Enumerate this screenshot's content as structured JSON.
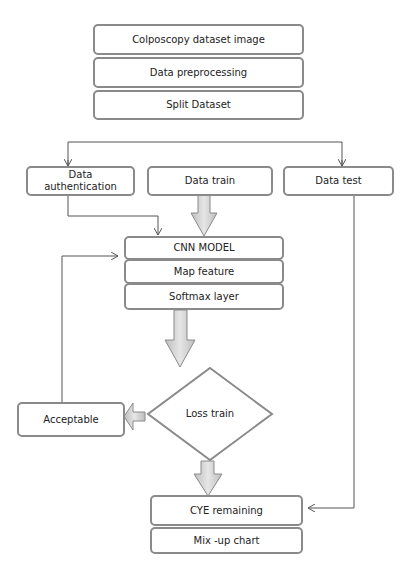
{
  "diagram": {
    "type": "flowchart",
    "top_stack": [
      "Colposcopy dataset image",
      "Data preprocessing",
      "Split Dataset"
    ],
    "split_branches": {
      "auth": "Data\nauthentication",
      "auth_line1": "Data",
      "auth_line2": "authentication",
      "train": "Data train",
      "test": "Data test"
    },
    "model_stack": [
      "CNN MODEL",
      "Map feature",
      "Softmax layer"
    ],
    "decision": "Loss train",
    "acceptable": "Acceptable",
    "output_stack": [
      "CYE remaining",
      "Mix -up chart"
    ],
    "colors": {
      "border": "#8a8a8a",
      "line": "#555555",
      "block_arrow_fill": "#d4d4d4"
    }
  }
}
